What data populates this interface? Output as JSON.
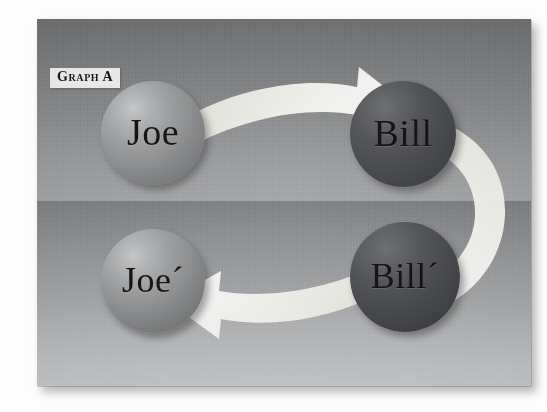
{
  "figure": {
    "caption_label": "Graph A",
    "kind": "directed-graph-diagram",
    "frame": {
      "shadow": "drop-shadow-bottom-right"
    },
    "background": {
      "split": "two horizontal gradient bands",
      "top_band_top_color": "#6f7173",
      "top_band_bottom_color": "#a2a4a6",
      "bottom_band_top_color": "#7b7d7f",
      "bottom_band_bottom_color": "#cbcdcf"
    },
    "palette": {
      "arrow_color": "#f0efe9",
      "light_sphere": "#9a9c9e",
      "dark_sphere": "#4e5053",
      "label_bg": "#f2f2f0",
      "label_text": "#111111"
    }
  },
  "nodes": [
    {
      "id": "joe",
      "label": "Joe",
      "tone": "light",
      "row": "top",
      "column": "left"
    },
    {
      "id": "bill",
      "label": "Bill",
      "tone": "dark",
      "row": "top",
      "column": "right"
    },
    {
      "id": "joep",
      "label": "Joe´",
      "tone": "light",
      "row": "bottom",
      "column": "left"
    },
    {
      "id": "billp",
      "label": "Bill´",
      "tone": "dark",
      "row": "bottom",
      "column": "right"
    }
  ],
  "edges": [
    {
      "id": "joe-to-bill",
      "from": "Joe",
      "to": "Bill",
      "style": "curved-ribbon-arrow",
      "direction": "right"
    },
    {
      "id": "bill-to-billp",
      "from": "Bill",
      "to": "Bill´",
      "style": "curved-ribbon-band",
      "direction": "down"
    },
    {
      "id": "billp-to-joep",
      "from": "Bill´",
      "to": "Joe´",
      "style": "curved-ribbon-arrow",
      "direction": "left"
    }
  ]
}
